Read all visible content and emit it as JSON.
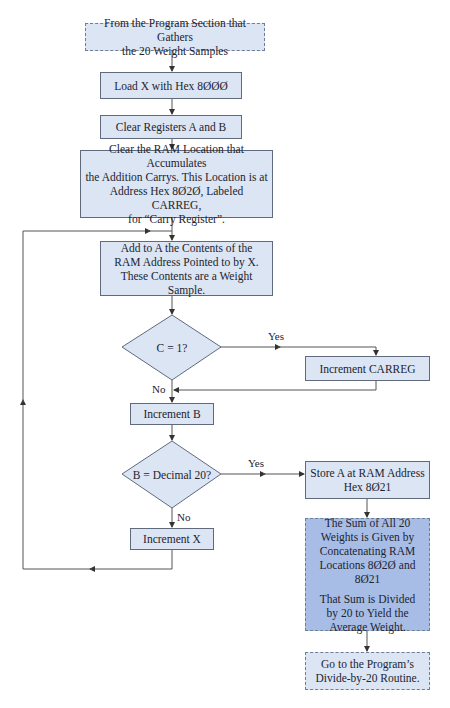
{
  "flowchart": {
    "start": {
      "lines": [
        "From the Program Section that Gathers",
        "the 20 Weight Samples"
      ]
    },
    "load_x": {
      "text": "Load X with Hex 8ØØØ"
    },
    "clear_ab": {
      "text": "Clear Registers A and B"
    },
    "clear_ram": {
      "lines": [
        "Clear the RAM Location that Accumulates",
        "the Addition Carrys. This Location is at",
        "Address Hex 8Ø2Ø, Labeled CARREG,",
        "for “Carry Register”."
      ]
    },
    "add_to_a": {
      "lines": [
        "Add to A the Contents of the",
        "RAM Address Pointed to by X.",
        "These Contents are a Weight Sample."
      ]
    },
    "decision_carry": {
      "text": "C = 1?",
      "yes": "Yes",
      "no": "No"
    },
    "inc_carreg": {
      "text": "Increment CARREG"
    },
    "inc_b": {
      "text": "Increment B"
    },
    "decision_b": {
      "text": "B = Decimal 20?",
      "yes": "Yes",
      "no": "No"
    },
    "inc_x": {
      "text": "Increment X"
    },
    "store_a": {
      "lines": [
        "Store A at RAM Address",
        "Hex 8Ø21"
      ]
    },
    "sum_note": {
      "para1": [
        "The Sum of All 20",
        "Weights is Given by",
        "Concatenating RAM",
        "Locations 8Ø2Ø and 8Ø21"
      ],
      "para2": [
        "That Sum is Divided",
        "by 20 to Yield the",
        "Average Weight."
      ]
    },
    "end": {
      "lines": [
        "Go to the Program’s",
        "Divide-by-20 Routine."
      ]
    }
  },
  "colors": {
    "box_fill": "#dbe5f4",
    "highlight_fill": "#a8bde6",
    "border": "#5f6b7d",
    "line": "#555555"
  }
}
